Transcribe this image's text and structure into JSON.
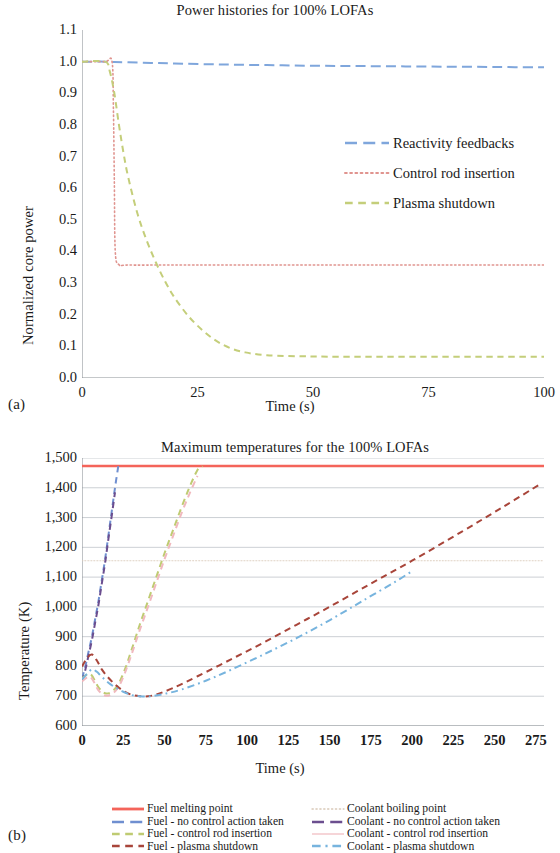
{
  "figure": {
    "panel_a_label": "(a)",
    "panel_b_label": "(b)"
  },
  "colors": {
    "reactivity_feedbacks": "#7FA6DC",
    "control_rod_insertion": "#E0948F",
    "plasma_shutdown": "#C4CE7A",
    "fuel_melting_point": "#F4645A",
    "coolant_boiling_point": "#D9C9B8",
    "fuel_no_control": "#6F8FD0",
    "coolant_no_control": "#6B4E8F",
    "fuel_control_rod": "#BFCB72",
    "coolant_control_rod": "#F0B9BE",
    "fuel_plasma_shutdown": "#A8453A",
    "coolant_plasma_shutdown": "#77B4DE",
    "gridline": "#BFC4C9",
    "axis": "#8C9196",
    "text": "#1a1a1a"
  },
  "chart_data": [
    {
      "id": "power-histories",
      "type": "line",
      "title": "Power histories for 100% LOFAs",
      "xlabel": "Time (s)",
      "ylabel": "Normalized core power",
      "xlim": [
        0,
        100
      ],
      "ylim": [
        0.0,
        1.1
      ],
      "xticks": [
        0,
        25,
        50,
        75,
        100
      ],
      "xtick_labels": [
        "0",
        "25",
        "50",
        "75",
        "100"
      ],
      "yticks": [
        0.0,
        0.1,
        0.2,
        0.3,
        0.4,
        0.5,
        0.6,
        0.7,
        0.8,
        0.9,
        1.0,
        1.1
      ],
      "ytick_labels": [
        "0.0",
        "0.1",
        "0.2",
        "0.3",
        "0.4",
        "0.5",
        "0.6",
        "0.7",
        "0.8",
        "0.9",
        "1.0",
        "1.1"
      ],
      "grid": false,
      "legend_position": "inside-right",
      "series": [
        {
          "name": "Reactivity feedbacks",
          "color_key": "reactivity_feedbacks",
          "dash": "long-dash",
          "x": [
            0,
            2,
            5,
            7,
            10,
            15,
            20,
            30,
            40,
            50,
            60,
            70,
            80,
            90,
            100
          ],
          "y": [
            1.0,
            1.0,
            1.0,
            0.999,
            0.998,
            0.996,
            0.994,
            0.991,
            0.989,
            0.987,
            0.986,
            0.985,
            0.984,
            0.983,
            0.982
          ]
        },
        {
          "name": "Control rod insertion",
          "color_key": "control_rod_insertion",
          "dash": "dotted",
          "x": [
            0,
            5,
            6.5,
            6.8,
            7,
            7.2,
            8,
            10,
            20,
            40,
            60,
            80,
            100
          ],
          "y": [
            1.0,
            1.0,
            1.0,
            0.85,
            0.62,
            0.4,
            0.358,
            0.357,
            0.357,
            0.357,
            0.357,
            0.357,
            0.357
          ]
        },
        {
          "name": "Plasma shutdown",
          "color_key": "plasma_shutdown",
          "dash": "dash",
          "x": [
            0,
            5,
            6,
            7,
            8,
            9,
            10,
            12,
            14,
            16,
            18,
            20,
            23,
            26,
            29,
            32,
            35,
            40,
            50,
            60,
            70,
            80,
            90,
            100
          ],
          "y": [
            1.0,
            1.0,
            0.97,
            0.9,
            0.8,
            0.71,
            0.635,
            0.52,
            0.435,
            0.365,
            0.305,
            0.255,
            0.196,
            0.152,
            0.118,
            0.095,
            0.082,
            0.072,
            0.068,
            0.067,
            0.067,
            0.067,
            0.067,
            0.067
          ]
        }
      ]
    },
    {
      "id": "maximum-temperatures",
      "type": "line",
      "title": "Maximum temperatures for the 100% LOFAs",
      "xlabel": "Time (s)",
      "ylabel": "Temperature (K)",
      "xlim": [
        0,
        280
      ],
      "ylim": [
        600,
        1500
      ],
      "xticks": [
        0,
        25,
        50,
        75,
        100,
        125,
        150,
        175,
        200,
        225,
        250,
        275
      ],
      "xtick_labels": [
        "0",
        "25",
        "50",
        "75",
        "100",
        "125",
        "150",
        "175",
        "200",
        "225",
        "250",
        "275"
      ],
      "yticks": [
        600,
        700,
        800,
        900,
        1000,
        1100,
        1200,
        1300,
        1400,
        1500
      ],
      "ytick_labels": [
        "600",
        "700",
        "800",
        "900",
        "1,000",
        "1,100",
        "1,200",
        "1,300",
        "1,400",
        "1,500"
      ],
      "grid": true,
      "legend_position": "below",
      "series": [
        {
          "name": "Fuel melting point",
          "color_key": "fuel_melting_point",
          "dash": "solid",
          "x": [
            0,
            280
          ],
          "y": [
            1473,
            1473
          ]
        },
        {
          "name": "Coolant boiling point",
          "color_key": "coolant_boiling_point",
          "dash": "fine-dotted",
          "x": [
            0,
            280
          ],
          "y": [
            1155,
            1155
          ]
        },
        {
          "name": "Fuel - no control action taken",
          "color_key": "fuel_no_control",
          "dash": "dash",
          "x": [
            0,
            2,
            4,
            6,
            8,
            10,
            12,
            14,
            16,
            18,
            20,
            22
          ],
          "y": [
            760,
            800,
            850,
            900,
            960,
            1020,
            1090,
            1160,
            1240,
            1320,
            1400,
            1473
          ]
        },
        {
          "name": "Coolant - no control action taken",
          "color_key": "coolant_no_control",
          "dash": "dash",
          "x": [
            0,
            2,
            4,
            6,
            8,
            10,
            12,
            14,
            16,
            18,
            20
          ],
          "y": [
            750,
            788,
            838,
            888,
            948,
            1008,
            1078,
            1148,
            1228,
            1305,
            1385
          ]
        },
        {
          "name": "Fuel - control rod insertion",
          "color_key": "fuel_control_rod",
          "dash": "dash",
          "x": [
            0,
            5,
            10,
            14,
            18,
            22,
            26,
            30,
            35,
            40,
            45,
            50,
            55,
            60,
            65,
            70,
            73
          ],
          "y": [
            760,
            775,
            730,
            710,
            715,
            740,
            790,
            855,
            940,
            1020,
            1100,
            1180,
            1255,
            1330,
            1400,
            1460,
            1473
          ]
        },
        {
          "name": "Coolant - control rod insertion",
          "color_key": "coolant_control_rod",
          "dash": "dash",
          "x": [
            0,
            5,
            10,
            14,
            18,
            22,
            26,
            30,
            35,
            40,
            45,
            50,
            55,
            60,
            65,
            70
          ],
          "y": [
            750,
            765,
            720,
            702,
            707,
            730,
            778,
            840,
            922,
            1000,
            1080,
            1160,
            1235,
            1310,
            1378,
            1440
          ]
        },
        {
          "name": "Fuel - plasma shutdown",
          "color_key": "fuel_plasma_shutdown",
          "dash": "dash",
          "x": [
            0,
            3,
            6,
            9,
            12,
            16,
            20,
            25,
            30,
            35,
            40,
            45,
            55,
            70,
            90,
            110,
            130,
            150,
            175,
            200,
            230,
            255,
            277
          ],
          "y": [
            800,
            828,
            840,
            820,
            790,
            762,
            740,
            718,
            705,
            700,
            700,
            706,
            727,
            767,
            823,
            880,
            940,
            1000,
            1078,
            1155,
            1252,
            1335,
            1410
          ]
        },
        {
          "name": "Coolant - plasma shutdown",
          "color_key": "coolant_plasma_shutdown",
          "dash": "dash-dot",
          "x": [
            0,
            3,
            6,
            9,
            12,
            16,
            20,
            25,
            30,
            35,
            42,
            50,
            60,
            75,
            90,
            110,
            130,
            150,
            170,
            190,
            200
          ],
          "y": [
            757,
            775,
            790,
            782,
            765,
            745,
            730,
            715,
            704,
            700,
            700,
            708,
            722,
            752,
            788,
            840,
            895,
            955,
            1020,
            1085,
            1120
          ]
        }
      ]
    }
  ],
  "legend_a": [
    {
      "label": "Reactivity feedbacks",
      "color_key": "reactivity_feedbacks",
      "dash": "long-dash"
    },
    {
      "label": "Control rod insertion",
      "color_key": "control_rod_insertion",
      "dash": "dotted"
    },
    {
      "label": "Plasma shutdown",
      "color_key": "plasma_shutdown",
      "dash": "dash"
    }
  ],
  "legend_b": [
    {
      "label": "Fuel melting point",
      "color_key": "fuel_melting_point",
      "dash": "solid"
    },
    {
      "label": "Coolant boiling point",
      "color_key": "coolant_boiling_point",
      "dash": "fine-dotted"
    },
    {
      "label": "Fuel - no control action taken",
      "color_key": "fuel_no_control",
      "dash": "long-dash"
    },
    {
      "label": "Coolant - no control action taken",
      "color_key": "coolant_no_control",
      "dash": "long-dash"
    },
    {
      "label": "Fuel - control rod insertion",
      "color_key": "fuel_control_rod",
      "dash": "dash"
    },
    {
      "label": "Coolant - control rod insertion",
      "color_key": "coolant_control_rod",
      "dash": "solid-thin"
    },
    {
      "label": "Fuel - plasma shutdown",
      "color_key": "fuel_plasma_shutdown",
      "dash": "dash"
    },
    {
      "label": "Coolant - plasma shutdown",
      "color_key": "coolant_plasma_shutdown",
      "dash": "dash-dot"
    }
  ]
}
